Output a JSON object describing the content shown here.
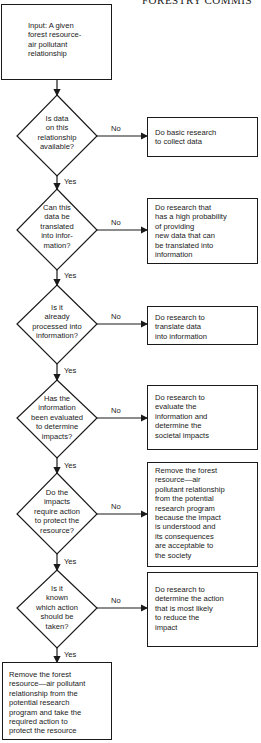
{
  "header": {
    "text": "FORESTRY COMMIS"
  },
  "start": {
    "text": "Input: A given\nforest resource-\nair pollutant\nrelationship"
  },
  "decisions": [
    {
      "question": "Is data\non this\nrelationship\navailable?",
      "no_label": "No",
      "yes_label": "Yes",
      "no_action": "Do basic research\nto collect data"
    },
    {
      "question": "Can this\ndata be\ntranslated\ninto infor-\nmation?",
      "no_label": "No",
      "yes_label": "Yes",
      "no_action": "Do research that\nhas a high probability\nof providing\nnew data that can\nbe translated into\ninformation"
    },
    {
      "question": "Is it\nalready\nprocessed into\ninformation?",
      "no_label": "No",
      "yes_label": "Yes",
      "no_action": "Do research to\ntranslate data\ninto information"
    },
    {
      "question": "Has the\ninformation\nbeen evaluated\nto determine\nimpacts?",
      "no_label": "No",
      "yes_label": "Yes",
      "no_action": "Do research to\nevaluate the\ninformation and\ndetermine the\nsocietal impacts"
    },
    {
      "question": "Do the\nimpacts\nrequire action\nto protect the\nresource?",
      "no_label": "No",
      "yes_label": "Yes",
      "no_action": "Remove the forest\nresource—air\npollutant relationship\nfrom the potential\nresearch program\nbecause the impact\nis understood and\nits consequences\nare acceptable to\nthe society"
    },
    {
      "question": "Is it\nknown\nwhich action\nshould be\ntaken?",
      "no_label": "No",
      "yes_label": "Yes",
      "no_action": "Do research to\ndetermine the action\nthat is most likely\nto reduce the\nimpact"
    }
  ],
  "end": {
    "text": "Remove the forest\nresource—air pollutant\nrelationship from the\npotential research\nprogram and take the\nrequired action to\nprotect the resource"
  }
}
